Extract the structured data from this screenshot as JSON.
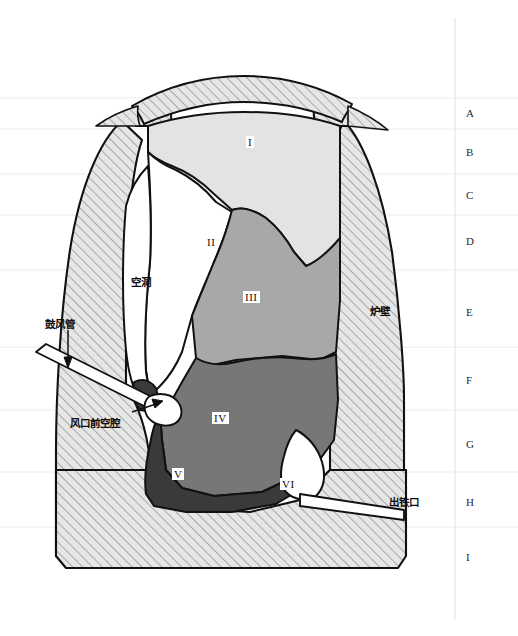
{
  "figure": {
    "kind": "blast-furnace-dissection-cross-section",
    "background_color": "#ffffff",
    "outline_color": "#111111",
    "hatch_color": "#8c8c8c",
    "grid_color": "#ececec"
  },
  "zones": [
    {
      "id": "I",
      "label": "I",
      "fill": "#e3e3e3",
      "x": 246,
      "y": 136
    },
    {
      "id": "II",
      "label": "II",
      "fill": "#ffffff",
      "x": 205,
      "y": 236
    },
    {
      "id": "III",
      "label": "III",
      "fill": "#a8a8a8",
      "x": 247,
      "y": 291
    },
    {
      "id": "IV",
      "label": "IV",
      "fill": "#777777",
      "x": 214,
      "y": 412
    },
    {
      "id": "V",
      "label": "V",
      "fill": "#3a3a3a",
      "x": 172,
      "y": 468
    },
    {
      "id": "VI",
      "label": "VI",
      "fill": "#ffffff",
      "x": 282,
      "y": 481
    }
  ],
  "annotations": [
    {
      "name": "blast-pipe",
      "text": "鼓风管",
      "x": 45,
      "y": 318
    },
    {
      "name": "raceway-cavity",
      "text": "风口前空腔",
      "x": 70,
      "y": 417
    },
    {
      "name": "cavity",
      "text": "空洞",
      "x": 131,
      "y": 276
    },
    {
      "name": "furnace-wall",
      "text": "炉壁",
      "x": 370,
      "y": 305
    },
    {
      "name": "taphole",
      "text": "出铁口",
      "x": 389,
      "y": 496
    }
  ],
  "margin_rows": [
    {
      "letter": "A",
      "y": 112
    },
    {
      "letter": "B",
      "y": 151
    },
    {
      "letter": "C",
      "y": 194
    },
    {
      "letter": "D",
      "y": 240
    },
    {
      "letter": "E",
      "y": 311
    },
    {
      "letter": "F",
      "y": 379
    },
    {
      "letter": "G",
      "y": 443
    },
    {
      "letter": "H",
      "y": 501
    },
    {
      "letter": "I",
      "y": 556
    }
  ],
  "grid_lines_y": [
    98,
    129,
    174,
    215,
    270,
    347,
    410,
    472,
    527
  ],
  "margin_divider_x": 455
}
